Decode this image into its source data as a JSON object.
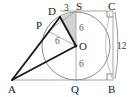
{
  "figure": {
    "canvas": {
      "width": 130,
      "height": 97
    },
    "colors": {
      "background": "#ffffff",
      "thick_stroke": "#1a1a1a",
      "thin_stroke": "#8c8c8c",
      "square_stroke": "#a0a0a0",
      "circle_stroke": "#8c8c8c",
      "shaded_fill": "#d2d2d2",
      "label_dark": "#1a1a1a",
      "label_gray": "#555555"
    },
    "points": [
      {
        "id": "A",
        "label": "A",
        "x": 12,
        "y": 80,
        "lx": 8,
        "ly": 93
      },
      {
        "id": "B",
        "label": "B",
        "x": 113,
        "y": 80,
        "lx": 110,
        "ly": 93
      },
      {
        "id": "C",
        "label": "C",
        "x": 113,
        "y": 11,
        "lx": 110,
        "ly": 9
      },
      {
        "id": "D",
        "label": "D",
        "x": 60,
        "y": 17,
        "lx": 50,
        "ly": 14
      },
      {
        "id": "S",
        "label": "S",
        "x": 76,
        "y": 11,
        "lx": 77,
        "ly": 9
      },
      {
        "id": "Q",
        "label": "Q",
        "x": 76,
        "y": 80,
        "lx": 72,
        "ly": 93
      },
      {
        "id": "O",
        "label": "O",
        "x": 76,
        "y": 46,
        "lx": 79,
        "ly": 50
      },
      {
        "id": "P",
        "label": "P",
        "x": 48,
        "y": 31,
        "lx": 38,
        "ly": 28
      }
    ],
    "circle": {
      "cx": 76,
      "cy": 46,
      "r": 34
    },
    "measures": [
      {
        "id": "ds",
        "text": "3",
        "x": 66,
        "y": 10,
        "style": "dark",
        "describes": "segment D to S along the top edge"
      },
      {
        "id": "so",
        "text": "6",
        "x": 80,
        "y": 30,
        "style": "gray",
        "describes": "radius from S down to O"
      },
      {
        "id": "oq",
        "text": "6",
        "x": 80,
        "y": 65,
        "style": "gray",
        "describes": "radius from O down to Q"
      },
      {
        "id": "po",
        "text": "6",
        "x": 57,
        "y": 42,
        "style": "gray",
        "describes": "radius from P to O"
      },
      {
        "id": "bc",
        "text": "12",
        "x": 119,
        "y": 48,
        "style": "dark",
        "describes": "side length of the square, marked on the right with a brace"
      }
    ],
    "shaded_region": {
      "label": "triangle D-S-O",
      "vertices": "D,S,O",
      "fill": "#d2d2d2"
    },
    "right_angles": [
      {
        "id": "angle-c",
        "at": "C"
      },
      {
        "id": "angle-b",
        "at": "B"
      }
    ],
    "thick_segments": [
      {
        "from": "A",
        "to": "D"
      },
      {
        "from": "A",
        "to": "O"
      },
      {
        "from": "D",
        "to": "O"
      },
      {
        "from": "P",
        "to": "D"
      }
    ],
    "thin_segments": [
      {
        "from": "P",
        "to": "O"
      },
      {
        "from": "S",
        "to": "O"
      },
      {
        "from": "O",
        "to": "Q"
      }
    ],
    "square_edges": [
      {
        "from": "A",
        "to": "B"
      },
      {
        "from": "B",
        "to": "C"
      },
      {
        "from": "C",
        "to": "S"
      },
      {
        "from": "S",
        "to": "D"
      },
      {
        "from": "A",
        "to": "Q"
      }
    ]
  }
}
